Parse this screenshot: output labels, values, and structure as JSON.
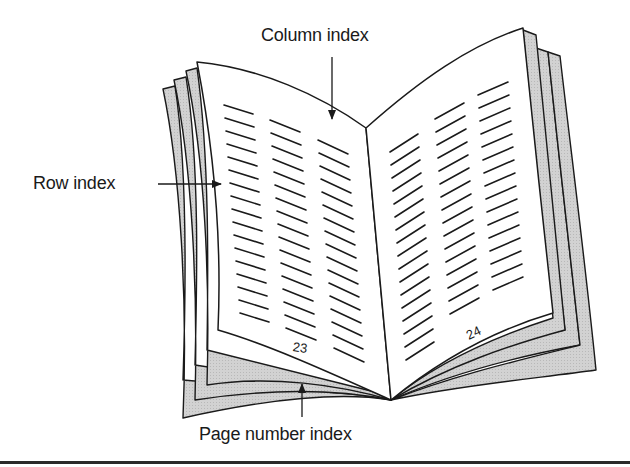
{
  "diagram": {
    "type": "annotated-illustration",
    "labels": {
      "column_index": "Column index",
      "row_index": "Row index",
      "page_number_index": "Page number index"
    },
    "pages": {
      "left_page_number": "23",
      "right_page_number": "24"
    },
    "text_columns": {
      "left_page_columns": 3,
      "right_page_columns": 3
    },
    "colors": {
      "line": "#1a1a1a",
      "page_fill": "#ffffff",
      "back_sheet_fill": "#cfcfcf",
      "background": "#ffffff"
    }
  }
}
